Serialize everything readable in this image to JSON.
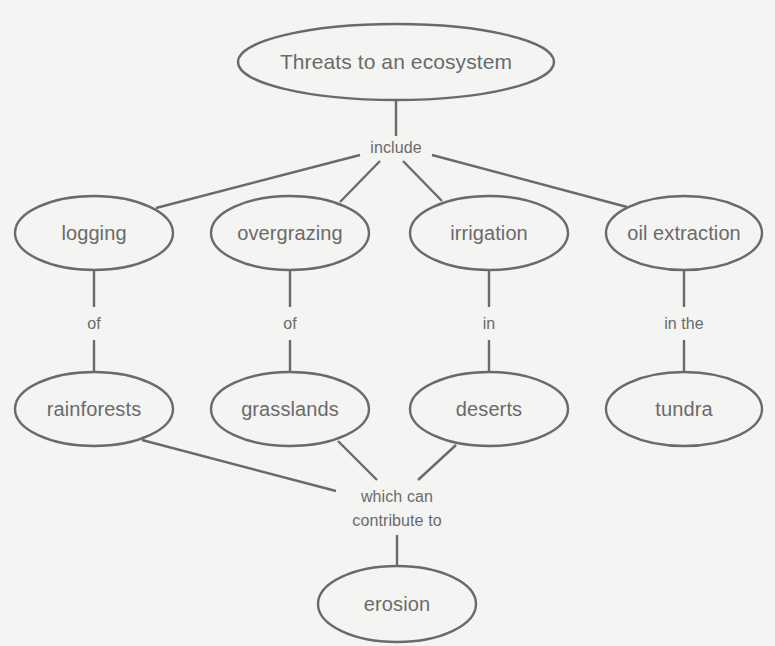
{
  "diagram": {
    "title_node": {
      "label": "Threats to an ecosystem",
      "cx": 396,
      "cy": 62,
      "rx": 158,
      "ry": 38
    },
    "link_include": {
      "label": "include",
      "x": 396,
      "y": 148
    },
    "threats": [
      {
        "label": "logging",
        "cx": 94,
        "cy": 233,
        "rx": 79,
        "ry": 37
      },
      {
        "label": "overgrazing",
        "cx": 290,
        "cy": 233,
        "rx": 79,
        "ry": 37
      },
      {
        "label": "irrigation",
        "cx": 489,
        "cy": 233,
        "rx": 79,
        "ry": 37
      },
      {
        "label": "oil extraction",
        "cx": 684,
        "cy": 233,
        "rx": 79,
        "ry": 37
      }
    ],
    "relations": [
      {
        "label": "of",
        "x": 94,
        "y": 324
      },
      {
        "label": "of",
        "x": 290,
        "y": 324
      },
      {
        "label": "in",
        "x": 489,
        "y": 324
      },
      {
        "label": "in the",
        "x": 684,
        "y": 324
      }
    ],
    "ecosystems": [
      {
        "label": "rainforests",
        "cx": 94,
        "cy": 409,
        "rx": 79,
        "ry": 37
      },
      {
        "label": "grasslands",
        "cx": 290,
        "cy": 409,
        "rx": 79,
        "ry": 37
      },
      {
        "label": "deserts",
        "cx": 489,
        "cy": 409,
        "rx": 79,
        "ry": 37
      },
      {
        "label": "tundra",
        "cx": 684,
        "cy": 409,
        "rx": 79,
        "ry": 37
      }
    ],
    "link_contribute": {
      "line1": "which can",
      "line2": "contribute to",
      "x": 397,
      "y": 509
    },
    "result_node": {
      "label": "erosion",
      "cx": 397,
      "cy": 604,
      "rx": 79,
      "ry": 38
    },
    "colors": {
      "stroke": "#6a6a6a",
      "text": "#6a6a6a",
      "background": "#f4f4f3"
    }
  }
}
